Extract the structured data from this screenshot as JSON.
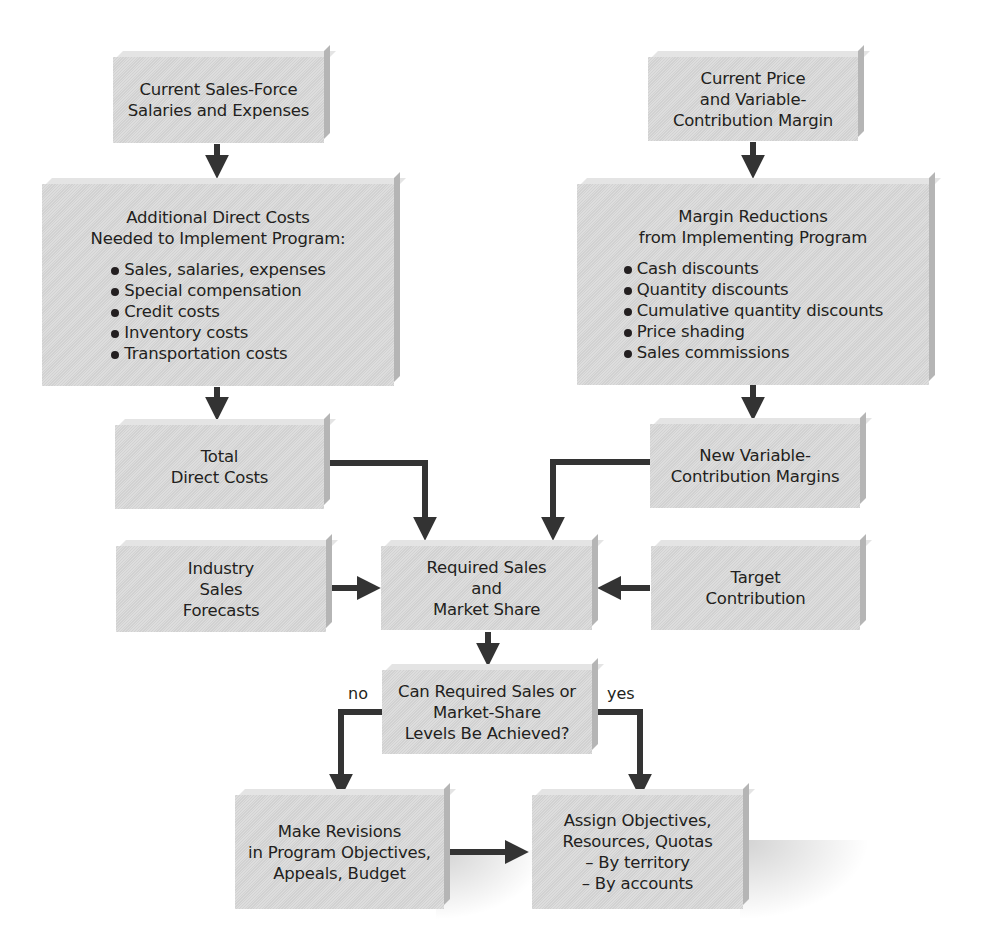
{
  "diagram": {
    "type": "flowchart",
    "nodes": {
      "current_salesforce": {
        "title": "Current Sales-Force\nSalaries and Expenses"
      },
      "additional_direct_costs": {
        "title": "Additional Direct Costs\nNeeded to Implement Program:",
        "items": [
          "Sales, salaries, expenses",
          "Special compensation",
          "Credit costs",
          "Inventory costs",
          "Transportation costs"
        ]
      },
      "total_direct_costs": {
        "title": "Total\nDirect Costs"
      },
      "current_price": {
        "title": "Current Price\nand Variable-\nContribution Margin"
      },
      "margin_reductions": {
        "title": "Margin Reductions\nfrom Implementing Program",
        "items": [
          "Cash discounts",
          "Quantity discounts",
          "Cumulative quantity discounts",
          "Price shading",
          "Sales commissions"
        ]
      },
      "new_margins": {
        "title": "New Variable-\nContribution Margins"
      },
      "industry_forecasts": {
        "title": "Industry\nSales\nForecasts"
      },
      "required_sales": {
        "title": "Required Sales\nand\nMarket Share"
      },
      "target_contribution": {
        "title": "Target\nContribution"
      },
      "decision": {
        "title": "Can Required Sales or\nMarket-Share\nLevels Be Achieved?"
      },
      "make_revisions": {
        "title": "Make Revisions\nin Program Objectives,\nAppeals, Budget"
      },
      "assign_objectives": {
        "title": "Assign Objectives,\nResources, Quotas\n– By territory\n– By accounts"
      }
    },
    "edge_labels": {
      "no": "no",
      "yes": "yes"
    },
    "edges": [
      {
        "from": "current_salesforce",
        "to": "additional_direct_costs"
      },
      {
        "from": "additional_direct_costs",
        "to": "total_direct_costs"
      },
      {
        "from": "current_price",
        "to": "margin_reductions"
      },
      {
        "from": "margin_reductions",
        "to": "new_margins"
      },
      {
        "from": "total_direct_costs",
        "to": "required_sales"
      },
      {
        "from": "new_margins",
        "to": "required_sales"
      },
      {
        "from": "industry_forecasts",
        "to": "required_sales"
      },
      {
        "from": "target_contribution",
        "to": "required_sales"
      },
      {
        "from": "required_sales",
        "to": "decision"
      },
      {
        "from": "decision",
        "to": "make_revisions",
        "label": "no"
      },
      {
        "from": "decision",
        "to": "assign_objectives",
        "label": "yes"
      },
      {
        "from": "make_revisions",
        "to": "assign_objectives"
      }
    ],
    "colors": {
      "box_fill": "#d9d9d9",
      "arrow": "#333333",
      "text": "#231f20"
    }
  }
}
